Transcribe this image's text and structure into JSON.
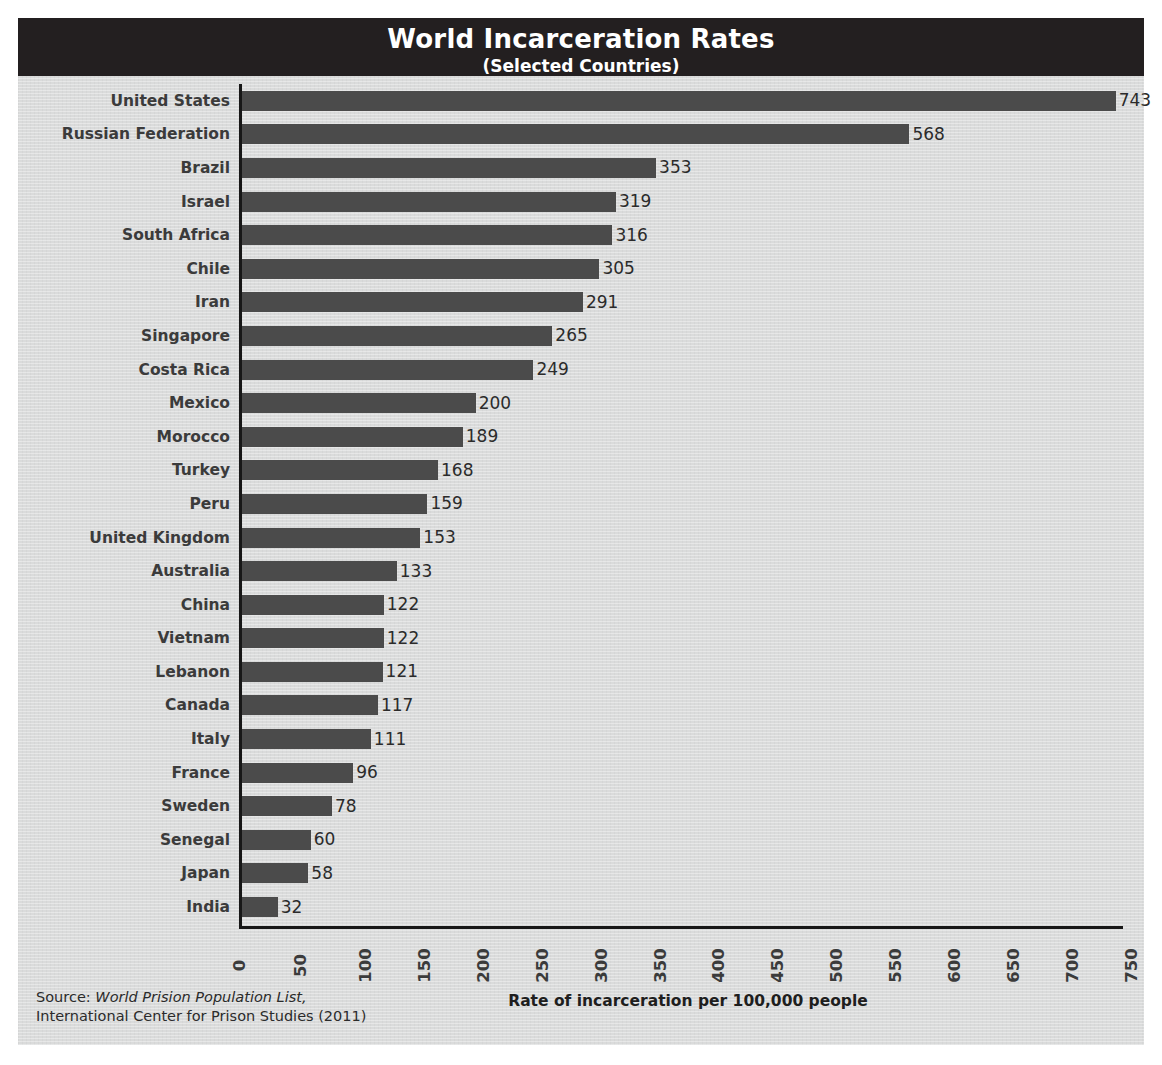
{
  "header": {
    "title": "World Incarceration Rates",
    "subtitle": "(Selected Countries)",
    "bar_color": "#231f20",
    "text_color": "#ffffff"
  },
  "colors": {
    "background": "#dadbdb",
    "bar": "#4b4b4b",
    "axis": "#171717",
    "label_text": "#3b3b3b",
    "value_text": "#2b2b2b"
  },
  "footer": {
    "source_prefix": "Source: ",
    "source_title": "World Prision Population List,",
    "source_org": "International Center for Prison Studies (2011)",
    "axis_title": "Rate of incarceration per 100,000 people"
  },
  "chart_data": {
    "type": "bar",
    "orientation": "horizontal",
    "title": "World Incarceration Rates",
    "subtitle": "(Selected Countries)",
    "xlabel": "Rate of incarceration per 100,000 people",
    "ylabel": "",
    "xlim": [
      0,
      750
    ],
    "xticks": [
      0,
      50,
      100,
      150,
      200,
      250,
      300,
      350,
      400,
      450,
      500,
      550,
      600,
      650,
      700,
      750
    ],
    "xtick_labels": [
      "0",
      "50",
      "100",
      "150",
      "200",
      "250",
      "300",
      "350",
      "400",
      "450",
      "500",
      "550",
      "600",
      "650",
      "700",
      "750"
    ],
    "xtick_rotation": -90,
    "grid": false,
    "legend": null,
    "data_labels": true,
    "categories": [
      "United States",
      "Russian Federation",
      "Brazil",
      "Israel",
      "South Africa",
      "Chile",
      "Iran",
      "Singapore",
      "Costa Rica",
      "Mexico",
      "Morocco",
      "Turkey",
      "Peru",
      "United Kingdom",
      "Australia",
      "China",
      "Vietnam",
      "Lebanon",
      "Canada",
      "Italy",
      "France",
      "Sweden",
      "Senegal",
      "Japan",
      "India"
    ],
    "values": [
      743,
      568,
      353,
      319,
      316,
      305,
      291,
      265,
      249,
      200,
      189,
      168,
      159,
      153,
      133,
      122,
      122,
      121,
      117,
      111,
      96,
      78,
      60,
      58,
      32
    ],
    "value_labels": [
      "743",
      "568",
      "353",
      "319",
      "316",
      "305",
      "291",
      "265",
      "249",
      "200",
      "189",
      "168",
      "159",
      "153",
      "133",
      "122",
      "122",
      "121",
      "117",
      "111",
      "96",
      "78",
      "60",
      "58",
      "32"
    ],
    "units": "prisoners per 100,000 population"
  }
}
